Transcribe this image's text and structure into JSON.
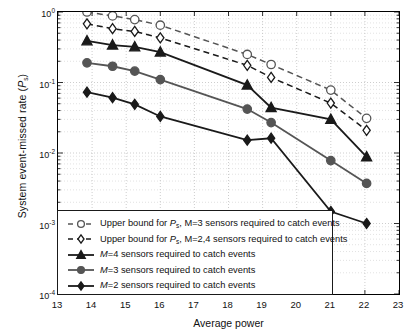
{
  "chart_data": {
    "type": "line",
    "title": "",
    "xlabel": "Average power",
    "ylabel": "System event-missed rate (Ps)",
    "ylabel_main": "System event-missed rate (",
    "ylabel_sym": "P",
    "ylabel_sub": "s",
    "ylabel_tail": ")",
    "xlim": [
      13,
      23
    ],
    "ylim": [
      0.0001,
      1
    ],
    "yscale": "log",
    "grid": true,
    "legend_position": "lower left",
    "xticks": [
      13,
      14,
      15,
      16,
      17,
      18,
      19,
      20,
      21,
      22,
      23
    ],
    "yticks": [
      "10^0",
      "10^-1",
      "10^-2",
      "10^-3",
      "10^-4"
    ],
    "ytick_exponents": [
      "0",
      "-1",
      "-2",
      "-3",
      "-4"
    ],
    "ytick_base": "10",
    "series": [
      {
        "name": "upper-bound-M3",
        "label_prefix": "Upper bound for ",
        "label_sym": "P",
        "label_sub": "s",
        "label_tail": ", M=3 sensors required to catch events",
        "marker": "circle-open",
        "color": "#555555",
        "line": "dashed",
        "x": [
          13.85,
          14.6,
          15.25,
          16.0,
          18.55,
          19.25,
          21.0,
          22.05
        ],
        "y": [
          1.0,
          0.88,
          0.78,
          0.65,
          0.25,
          0.18,
          0.078,
          0.031
        ]
      },
      {
        "name": "upper-bound-M24",
        "label_prefix": "Upper bound for ",
        "label_sym": "P",
        "label_sub": "s",
        "label_tail": ", M=2,4 sensors required to catch events",
        "marker": "diamond-open",
        "color": "#1a1a1a",
        "line": "dashed",
        "x": [
          13.85,
          14.6,
          15.25,
          16.0,
          18.55,
          19.25,
          21.0,
          22.05
        ],
        "y": [
          0.68,
          0.58,
          0.53,
          0.43,
          0.175,
          0.118,
          0.051,
          0.021
        ]
      },
      {
        "name": "M4",
        "label_prefix": "",
        "label_sym": "M",
        "label_sub": "",
        "label_tail": "=4 sensors required to catch events",
        "marker": "triangle",
        "color": "#1a1a1a",
        "line": "solid",
        "x": [
          13.85,
          14.6,
          15.25,
          16.0,
          18.55,
          19.25,
          21.0,
          22.05
        ],
        "y": [
          0.39,
          0.34,
          0.32,
          0.27,
          0.092,
          0.044,
          0.03,
          0.0088
        ]
      },
      {
        "name": "M3",
        "label_prefix": "",
        "label_sym": "M",
        "label_sub": "",
        "label_tail": "=3 sensors required to catch events",
        "marker": "circle-filled",
        "color": "#555555",
        "line": "solid",
        "x": [
          13.85,
          14.6,
          15.25,
          16.0,
          18.55,
          19.25,
          21.0,
          22.05
        ],
        "y": [
          0.19,
          0.17,
          0.145,
          0.11,
          0.042,
          0.027,
          0.0078,
          0.0037
        ]
      },
      {
        "name": "M2",
        "label_prefix": "",
        "label_sym": "M",
        "label_sub": "",
        "label_tail": "=2 sensors required to catch events",
        "marker": "diamond-filled",
        "color": "#1a1a1a",
        "line": "solid",
        "x": [
          13.85,
          14.6,
          15.25,
          16.0,
          18.55,
          19.25,
          21.0,
          22.05
        ],
        "y": [
          0.073,
          0.061,
          0.049,
          0.033,
          0.0152,
          0.0162,
          0.00148,
          0.001
        ]
      }
    ]
  }
}
